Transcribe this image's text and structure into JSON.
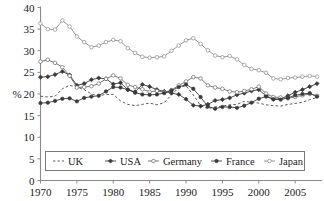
{
  "chart_data": {
    "type": "line",
    "title": "",
    "xlabel": "",
    "ylabel": "%",
    "xlim": [
      1970,
      2008
    ],
    "ylim": [
      0,
      40
    ],
    "grid": false,
    "legend_position": "bottom-inside",
    "xticks": [
      1970,
      1975,
      1980,
      1985,
      1990,
      1995,
      2000,
      2005
    ],
    "yticks": [
      0,
      5,
      10,
      15,
      20,
      25,
      30,
      35,
      40
    ],
    "x": [
      1970,
      1971,
      1972,
      1973,
      1974,
      1975,
      1976,
      1977,
      1978,
      1979,
      1980,
      1981,
      1982,
      1983,
      1984,
      1985,
      1986,
      1987,
      1988,
      1989,
      1990,
      1991,
      1992,
      1993,
      1994,
      1995,
      1996,
      1997,
      1998,
      1999,
      2000,
      2001,
      2002,
      2003,
      2004,
      2005,
      2006,
      2007,
      2008
    ],
    "series": [
      {
        "name": "UK",
        "marker": "none",
        "line_style": "dashed",
        "color": "#4a4a4a",
        "values": [
          19.5,
          19.3,
          19.5,
          21.2,
          22.0,
          21.6,
          21.0,
          20.0,
          19.6,
          19.9,
          19.9,
          18.4,
          17.6,
          17.3,
          17.6,
          17.9,
          17.5,
          18.0,
          19.8,
          21.5,
          21.9,
          19.8,
          17.3,
          16.6,
          17.0,
          17.2,
          17.5,
          17.6,
          18.3,
          18.1,
          17.9,
          17.5,
          17.3,
          17.2,
          17.6,
          17.8,
          18.1,
          18.7,
          19.2
        ]
      },
      {
        "name": "USA",
        "marker": "filled-diamond",
        "line_style": "solid",
        "color": "#3a3a3a",
        "values": [
          23.9,
          24.0,
          24.5,
          25.2,
          24.4,
          22.0,
          22.4,
          23.3,
          23.7,
          23.5,
          22.3,
          22.6,
          21.0,
          20.5,
          22.2,
          21.7,
          21.0,
          20.6,
          20.2,
          19.9,
          18.8,
          17.4,
          17.2,
          17.6,
          18.5,
          18.7,
          19.1,
          19.8,
          20.2,
          20.7,
          21.0,
          19.6,
          18.8,
          18.9,
          19.6,
          20.4,
          21.0,
          21.7,
          22.4
        ]
      },
      {
        "name": "Germany",
        "marker": "open-circle",
        "line_style": "solid",
        "color": "#6a6a6a",
        "values": [
          27.5,
          27.9,
          27.2,
          26.2,
          24.2,
          21.5,
          21.6,
          21.8,
          22.4,
          23.5,
          24.3,
          23.6,
          22.1,
          21.6,
          21.1,
          20.5,
          20.7,
          20.4,
          20.9,
          22.0,
          22.9,
          23.9,
          23.6,
          22.0,
          21.5,
          21.2,
          20.6,
          20.4,
          20.7,
          21.1,
          21.7,
          20.1,
          19.3,
          19.2,
          19.0,
          19.3,
          19.7,
          20.0,
          19.6
        ]
      },
      {
        "name": "France",
        "marker": "filled-circle",
        "line_style": "solid",
        "color": "#3a3a3a",
        "values": [
          17.9,
          18.0,
          18.4,
          18.9,
          19.0,
          18.3,
          19.1,
          19.4,
          19.6,
          20.6,
          21.6,
          21.5,
          21.0,
          20.3,
          19.9,
          19.8,
          19.9,
          20.2,
          20.8,
          21.6,
          22.2,
          21.2,
          19.3,
          17.1,
          16.6,
          17.0,
          17.0,
          16.8,
          17.3,
          18.0,
          18.9,
          19.4,
          18.8,
          18.7,
          19.1,
          19.7,
          20.0,
          20.2,
          19.4
        ]
      },
      {
        "name": "Japan",
        "marker": "open-circle-light",
        "line_style": "solid",
        "color": "#8b8b8b",
        "values": [
          36.3,
          35.0,
          34.9,
          37.0,
          35.6,
          33.3,
          32.0,
          30.8,
          31.2,
          32.0,
          32.5,
          32.2,
          30.6,
          29.5,
          28.6,
          28.4,
          28.5,
          28.7,
          30.0,
          31.2,
          32.4,
          32.9,
          31.6,
          30.1,
          28.9,
          28.5,
          28.8,
          28.0,
          26.7,
          25.8,
          25.5,
          24.9,
          23.6,
          23.4,
          23.7,
          23.8,
          24.0,
          24.2,
          24.0
        ]
      }
    ]
  },
  "legend": {
    "items": [
      {
        "label": "UK"
      },
      {
        "label": "USA"
      },
      {
        "label": "Germany"
      },
      {
        "label": "France"
      },
      {
        "label": "Japan"
      }
    ]
  },
  "axes": {
    "y_title": "%",
    "y_tick_labels": [
      "0",
      "5",
      "10",
      "15",
      "20",
      "25",
      "30",
      "35",
      "40"
    ],
    "x_tick_labels": [
      "1970",
      "1975",
      "1980",
      "1985",
      "1990",
      "1995",
      "2000",
      "2005"
    ]
  }
}
